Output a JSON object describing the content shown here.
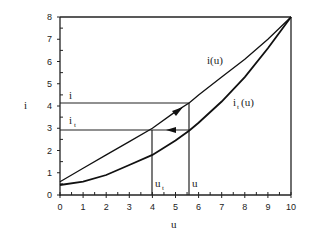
{
  "chart_data": {
    "type": "line",
    "title": "",
    "xlabel": "u",
    "ylabel": "i",
    "xlim": [
      0,
      10
    ],
    "ylim": [
      0,
      8
    ],
    "xticks": [
      "0",
      "1",
      "2",
      "3",
      "4",
      "5",
      "6",
      "7",
      "8",
      "9",
      "10"
    ],
    "yticks": [
      "0",
      "1",
      "2",
      "3",
      "4",
      "5",
      "6",
      "7",
      "8"
    ],
    "grid": false,
    "series": [
      {
        "name": "i(u)",
        "x": [
          0,
          1,
          2,
          3,
          4,
          5,
          5.6,
          6,
          7,
          8,
          9,
          10
        ],
        "y": [
          0.6,
          1.2,
          1.8,
          2.4,
          3.0,
          3.75,
          4.15,
          4.5,
          5.3,
          6.1,
          7.0,
          8.0
        ]
      },
      {
        "name": "i_t(u)",
        "x": [
          0,
          1,
          2,
          3,
          4,
          5,
          5.6,
          6,
          7,
          8,
          9,
          10
        ],
        "y": [
          0.45,
          0.6,
          0.9,
          1.35,
          1.8,
          2.45,
          2.9,
          3.25,
          4.2,
          5.3,
          6.6,
          8.0
        ]
      }
    ],
    "annotations": [
      {
        "text": "i",
        "type": "hline",
        "y": 4.15,
        "x_end": 5.6
      },
      {
        "text": "i_t",
        "type": "hline",
        "y": 2.9,
        "x_end": 5.6
      },
      {
        "text": "u_t",
        "type": "vline",
        "x": 4.0,
        "y_end": 2.9
      },
      {
        "text": "u",
        "type": "vline",
        "x": 5.6,
        "y_end": 4.15
      },
      {
        "text": "arrow along i(u) toward (5.6, 4.15)",
        "type": "arrow"
      },
      {
        "text": "arrow leftward along i=2.9 from (5.6, 2.9) toward (4.0, 2.9)",
        "type": "arrow"
      },
      {
        "text": "line from (0,8) to (10,8) top border",
        "type": "hline",
        "y": 8
      }
    ]
  },
  "labels": {
    "ylabel": "i",
    "xlabel": "u",
    "curve1": "i(u)",
    "curve2_main": "i",
    "curve2_sub": "t",
    "curve2_tail": "(u)",
    "hline_i": "i",
    "hline_it_main": "i",
    "hline_it_sub": "t",
    "vline_ut_main": "u",
    "vline_ut_sub": "t",
    "vline_u": "u"
  }
}
